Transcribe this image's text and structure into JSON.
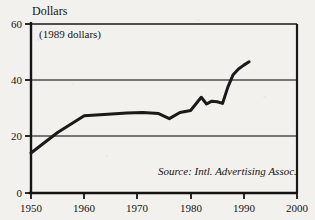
{
  "chart_data": {
    "type": "line",
    "title": "",
    "ylabel": "Dollars",
    "xlabel": "",
    "annotation": "(1989 dollars)",
    "source": "Source: Intl. Advertising Assoc.",
    "grid": "horizontal-at-20-and-40",
    "legend": "none",
    "xlim": [
      1950,
      2000
    ],
    "ylim": [
      0,
      60
    ],
    "yticks": [
      0,
      20,
      40,
      60
    ],
    "ytick_labels": [
      "0",
      "20",
      "40",
      "60"
    ],
    "xticks": [
      1950,
      1960,
      1970,
      1980,
      1990,
      2000
    ],
    "xtick_labels": [
      "1950",
      "1960",
      "1970",
      "1980",
      "1990",
      "2000"
    ],
    "series": [
      {
        "name": "Advertising spending per capita",
        "x": [
          1950,
          1955,
          1960,
          1963,
          1968,
          1971,
          1974,
          1976,
          1978,
          1980,
          1982,
          1983,
          1984,
          1985,
          1986,
          1987,
          1988,
          1989,
          1990,
          1991
        ],
        "values": [
          14.2,
          21.5,
          27.4,
          27.8,
          28.4,
          28.6,
          28.2,
          26.4,
          28.6,
          29.3,
          34.0,
          31.6,
          32.6,
          32.4,
          31.8,
          37.6,
          42.0,
          44.0,
          45.4,
          46.6
        ]
      }
    ],
    "colors": {
      "line": "#1a1a1a",
      "axis": "#141414",
      "grid": "#4a4a4a",
      "background": "#f3f1ee"
    }
  },
  "axes": {
    "y_title": "Dollars",
    "units_note": "(1989 dollars)",
    "source_note": "Source: Intl. Advertising Assoc."
  }
}
